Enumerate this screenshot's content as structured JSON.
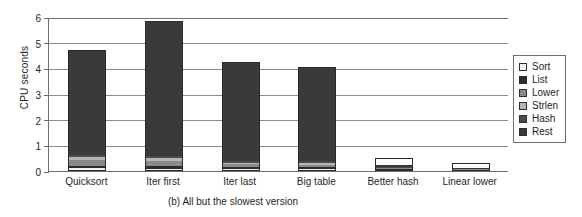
{
  "chart_data": {
    "type": "bar",
    "stacked": true,
    "title": "",
    "caption": "(b) All but the slowest version",
    "xlabel": "",
    "ylabel": "CPU seconds",
    "ylim": [
      0,
      6
    ],
    "yticks": [
      0,
      1,
      2,
      3,
      4,
      5,
      6
    ],
    "ytick_labels": [
      "0",
      "1",
      "2",
      "3",
      "4",
      "5",
      "6"
    ],
    "grid": true,
    "legend_position": "right-outside",
    "categories": [
      "Quicksort",
      "Iter first",
      "Iter last",
      "Big table",
      "Better hash",
      "Linear lower"
    ],
    "series": [
      {
        "name": "Sort",
        "color": "#f2f2f2",
        "values": [
          0.06,
          0.05,
          0.04,
          0.04,
          0.03,
          0.02
        ]
      },
      {
        "name": "List",
        "color": "#2b2b2b",
        "values": [
          0.1,
          0.09,
          0.09,
          0.08,
          0.05,
          0.04
        ]
      },
      {
        "name": "Lower",
        "color": "#8a8a8a",
        "values": [
          0.22,
          0.2,
          0.09,
          0.09,
          0.07,
          0.04
        ]
      },
      {
        "name": "Strlen",
        "color": "#b5b5b5",
        "values": [
          0.14,
          0.13,
          0.07,
          0.07,
          0.06,
          0.03
        ]
      },
      {
        "name": "Hash",
        "color": "#4a4a4a",
        "values": [
          0.08,
          0.08,
          0.06,
          0.07,
          0.05,
          0.03
        ]
      },
      {
        "name": "Rest",
        "color": "#3a3a3a",
        "values": [
          4.1,
          5.3,
          3.9,
          3.7,
          0.24,
          0.14
        ]
      }
    ],
    "totals": [
      4.7,
      5.85,
      4.25,
      4.05,
      0.5,
      0.3
    ]
  }
}
